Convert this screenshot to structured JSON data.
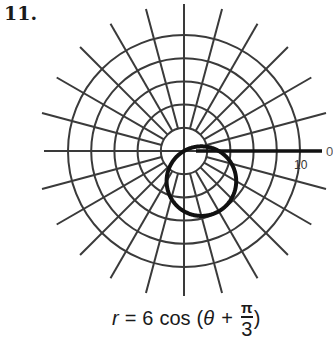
{
  "problem": {
    "number": "11."
  },
  "graph": {
    "axis_label_angle": "0",
    "radius_label": "10",
    "center": [
      184,
      151
    ],
    "px_per_unit": 11.6,
    "grid_circle_radii": [
      2,
      4,
      6,
      8,
      10
    ],
    "spoke_step_degrees": 15,
    "colors": {
      "grid": "#3a3a3a",
      "curve": "#111111",
      "background": "#ffffff"
    }
  },
  "equation": {
    "lhs": "r",
    "eq": "=",
    "coef": "6",
    "func": "cos",
    "open": "(",
    "theta": "θ",
    "plus": "+",
    "frac_num": "π",
    "frac_den": "3",
    "close": ")"
  },
  "chart_data": {
    "type": "polar",
    "equation": "r = 6cos(θ + π/3)",
    "curve": "circle of diameter 6 centered at polar (3, -π/3)",
    "r_grid": [
      2,
      4,
      6,
      8,
      10
    ],
    "r_max_label": 10,
    "theta_grid_step_deg": 15,
    "theta_labels": [
      "0"
    ],
    "points": [
      {
        "theta_deg": -60,
        "r": 6
      },
      {
        "theta_deg": 0,
        "r": 3
      },
      {
        "theta_deg": 30,
        "r": 0
      },
      {
        "theta_deg": -120,
        "r": 3
      },
      {
        "theta_deg": -150,
        "r": 0
      }
    ]
  }
}
